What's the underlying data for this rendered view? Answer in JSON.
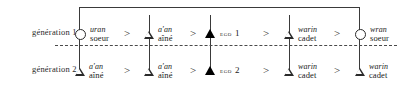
{
  "figure": {
    "generations": [
      {
        "id": "generation-1",
        "label": "génération 1",
        "nodes": [
          {
            "symbol": "circle",
            "sex": "female",
            "term_italic": "uran",
            "term_plain": "soeur",
            "ego": false
          },
          {
            "symbol": "triangle",
            "sex": "male",
            "term_italic": "a'an",
            "term_plain": "aîné",
            "ego": false
          },
          {
            "symbol": "triangle-filled",
            "sex": "male",
            "ego": true,
            "ego_label": "EGO",
            "ego_number": "1"
          },
          {
            "symbol": "triangle",
            "sex": "male",
            "term_italic": "warin",
            "term_plain": "cadet",
            "ego": false
          },
          {
            "symbol": "circle",
            "sex": "female",
            "term_italic": "wran",
            "term_plain": "soeur",
            "ego": false
          }
        ],
        "separators": [
          ">",
          ">",
          ">",
          ">"
        ]
      },
      {
        "id": "generation-2",
        "label": "génération 2",
        "nodes": [
          {
            "symbol": "triangle",
            "sex": "male",
            "term_italic": "a'an",
            "term_plain": "aîné",
            "ego": false
          },
          {
            "symbol": "triangle",
            "sex": "male",
            "term_italic": "a'an",
            "term_plain": "aîné",
            "ego": false
          },
          {
            "symbol": "triangle-filled",
            "sex": "male",
            "ego": true,
            "ego_label": "EGO",
            "ego_number": "2"
          },
          {
            "symbol": "triangle",
            "sex": "male",
            "term_italic": "warin",
            "term_plain": "cadet",
            "ego": false
          },
          {
            "symbol": "triangle",
            "sex": "male",
            "term_italic": "warin",
            "term_plain": "cadet",
            "ego": false
          }
        ],
        "separators": [
          ">",
          ">",
          ">",
          ">"
        ]
      }
    ],
    "colors": {
      "line": "#3a3a3a",
      "text": "#1a1a1a",
      "ego_fill": "#000000",
      "background": "#ffffff"
    }
  }
}
